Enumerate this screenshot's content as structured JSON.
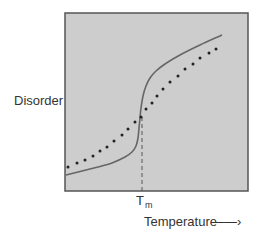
{
  "chart_data": {
    "type": "line",
    "title": "",
    "xlabel": "Temperature",
    "ylabel": "Disorder",
    "x_tick_labels": [
      {
        "label": "T",
        "subscript": "m",
        "x": 0.42
      }
    ],
    "grid": false,
    "legend": null,
    "axis_arrow": "→",
    "plot_area": {
      "x0": 65,
      "y0": 13,
      "x1": 248,
      "y1": 191,
      "fill": "#cdcdcd",
      "border": "#555555"
    },
    "series": [
      {
        "name": "sharp transition (solid)",
        "style": "solid",
        "color": "#666666",
        "points_px": [
          [
            66,
            175
          ],
          [
            82,
            171
          ],
          [
            98,
            167
          ],
          [
            112,
            163
          ],
          [
            125,
            157
          ],
          [
            132,
            152
          ],
          [
            136,
            146
          ],
          [
            138,
            138
          ],
          [
            139,
            128
          ],
          [
            140,
            118
          ],
          [
            141,
            108
          ],
          [
            143,
            96
          ],
          [
            146,
            86
          ],
          [
            150,
            78
          ],
          [
            156,
            71
          ],
          [
            165,
            64
          ],
          [
            180,
            55
          ],
          [
            200,
            45
          ],
          [
            222,
            35
          ]
        ]
      },
      {
        "name": "gradual transition (dotted)",
        "style": "dotted",
        "color": "#222222",
        "points_px": [
          [
            68,
            167
          ],
          [
            77,
            163
          ],
          [
            85,
            160
          ],
          [
            93,
            156
          ],
          [
            100,
            151
          ],
          [
            107,
            147
          ],
          [
            114,
            141
          ],
          [
            122,
            135
          ],
          [
            128,
            129
          ],
          [
            135,
            122
          ],
          [
            141,
            117
          ],
          [
            146,
            109
          ],
          [
            152,
            103
          ],
          [
            157,
            96
          ],
          [
            163,
            89
          ],
          [
            170,
            82
          ],
          [
            178,
            76
          ],
          [
            185,
            69
          ],
          [
            193,
            64
          ],
          [
            200,
            58
          ],
          [
            209,
            53
          ],
          [
            216,
            49
          ]
        ]
      }
    ],
    "transition_marker": {
      "label": "T_m",
      "x_px": 142,
      "y_from_px": 117,
      "y_to_px": 191,
      "style": "dashed"
    }
  },
  "labels": {
    "ylabel": "Disorder",
    "xlabel": "Temperature",
    "tm_main": "T",
    "tm_sub": "m",
    "arrow": "——›"
  }
}
